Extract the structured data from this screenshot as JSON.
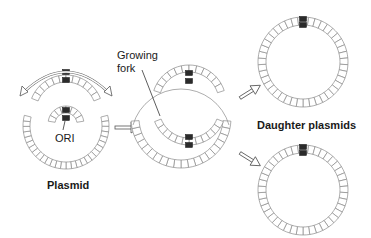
{
  "diagram": {
    "labels": {
      "ori": "ORI",
      "plasmid": "Plasmid",
      "growing_fork": "Growing\nfork",
      "growing_fork_line1": "Growing",
      "growing_fork_line2": "fork",
      "daughter_plasmids": "Daughter plasmids"
    },
    "stages": [
      {
        "name": "parent-plasmid",
        "description": "Plasmid with replication starting at ORI, bidirectional arrows"
      },
      {
        "name": "replicating-plasmid",
        "description": "Theta-form intermediate with growing forks"
      },
      {
        "name": "daughter-plasmid-1",
        "description": "Daughter plasmid (top)"
      },
      {
        "name": "daughter-plasmid-2",
        "description": "Daughter plasmid (bottom)"
      }
    ],
    "colors": {
      "segment_stroke": "#8a8a8a",
      "marker": "#2b2b2b",
      "text": "#1a1a1a",
      "background": "#ffffff"
    }
  }
}
